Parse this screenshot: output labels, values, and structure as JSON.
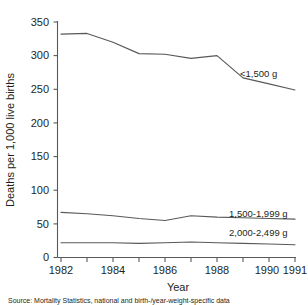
{
  "chart_data": {
    "type": "line",
    "title": "",
    "xlabel": "Year",
    "ylabel": "Deaths per 1,000 live births",
    "x": [
      1982,
      1983,
      1984,
      1985,
      1986,
      1987,
      1988,
      1989,
      1990,
      1991
    ],
    "xlim": [
      1982,
      1991
    ],
    "ylim": [
      0,
      350
    ],
    "ytick_labels": [
      "0",
      "50",
      "100",
      "150",
      "200",
      "250",
      "300",
      "350"
    ],
    "ytick_values": [
      0,
      50,
      100,
      150,
      200,
      250,
      300,
      350
    ],
    "xtick_values": [
      1982,
      1983,
      1984,
      1985,
      1986,
      1987,
      1988,
      1989,
      1990,
      1991
    ],
    "xtick_labels": [
      "1982",
      "",
      "1984",
      "",
      "1986",
      "",
      "1988",
      "",
      "1990",
      "1991"
    ],
    "grid": false,
    "legend_position": "inline-right",
    "series": [
      {
        "name": "<1,500 g",
        "label": "<1,500 g",
        "values": [
          332,
          333,
          320,
          303,
          302,
          296,
          300,
          267,
          258,
          249
        ]
      },
      {
        "name": "1,500-1,999 g",
        "label": "1,500-1,999 g",
        "values": [
          67,
          65,
          62,
          58,
          55,
          62,
          60,
          59,
          58,
          57
        ]
      },
      {
        "name": "2,000-2,499 g",
        "label": "2,000-2,499 g",
        "values": [
          22,
          22,
          22,
          21,
          22,
          23,
          22,
          21,
          20,
          19
        ]
      }
    ]
  },
  "axes": {
    "ylabel": "Deaths per 1,000 live births",
    "xlabel": "Year",
    "ytick_0": "0",
    "ytick_1": "50",
    "ytick_2": "100",
    "ytick_3": "150",
    "ytick_4": "200",
    "ytick_5": "250",
    "ytick_6": "300",
    "ytick_7": "350",
    "xtick_1982": "1982",
    "xtick_1984": "1984",
    "xtick_1986": "1986",
    "xtick_1988": "1988",
    "xtick_1990": "1990",
    "xtick_1991": "1991"
  },
  "series_labels": {
    "low": "<1,500 g",
    "mid": "1,500-1,999 g",
    "high": "2,000-2,499 g"
  },
  "footer": {
    "source": "Source: Mortality Statistics, national and birth-/year-weight-specific data"
  }
}
